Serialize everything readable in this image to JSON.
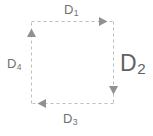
{
  "diagram": {
    "shape": "dashed-square",
    "stroke_color": "#b9bcbe",
    "label_color": "#6e7275",
    "background_color": "#ffffff",
    "arrow_direction": "clockwise",
    "labels": {
      "top": {
        "base": "D",
        "sub": "1",
        "name": "D1"
      },
      "right": {
        "base": "D",
        "sub": "2",
        "name": "D2"
      },
      "bottom": {
        "base": "D",
        "sub": "3",
        "name": "D3"
      },
      "left": {
        "base": "D",
        "sub": "4",
        "name": "D4"
      }
    },
    "arrows": [
      {
        "edge": "top",
        "points": "right",
        "label": "D1"
      },
      {
        "edge": "right",
        "points": "down",
        "label": "D2"
      },
      {
        "edge": "bottom",
        "points": "left",
        "label": "D3"
      },
      {
        "edge": "left",
        "points": "up",
        "label": "D4"
      }
    ]
  }
}
